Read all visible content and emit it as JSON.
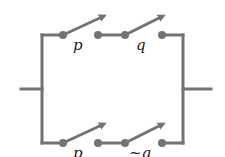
{
  "diagram": {
    "type": "switching-circuit",
    "wire_color": "#737373",
    "branches": [
      {
        "name": "top",
        "switches": [
          {
            "label": "p"
          },
          {
            "label": "q"
          }
        ]
      },
      {
        "name": "bottom",
        "switches": [
          {
            "label": "p"
          },
          {
            "label": "~q"
          }
        ]
      }
    ]
  }
}
